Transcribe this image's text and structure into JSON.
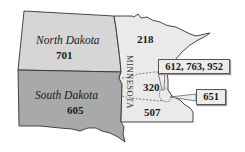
{
  "map": {
    "type": "area-code-map",
    "regions": [
      {
        "id": "north-dakota",
        "name": "North Dakota",
        "codes": "701",
        "fill": "#d6d6d6"
      },
      {
        "id": "south-dakota",
        "name": "South Dakota",
        "codes": "605",
        "fill": "#a9a9a9"
      },
      {
        "id": "minnesota",
        "name": "MINNESOTA",
        "fill": "#eaeaea",
        "areas": [
          {
            "code": "218"
          },
          {
            "code": "320"
          },
          {
            "code": "507"
          }
        ]
      }
    ],
    "callouts": [
      {
        "codes": "612, 763, 952"
      },
      {
        "codes": "651"
      }
    ],
    "colors": {
      "outline": "#333333",
      "nd_fill": "#d6d6d6",
      "sd_fill": "#a9a9a9",
      "mn_fill": "#eaeaea",
      "callout_fill": "#ececec"
    }
  }
}
